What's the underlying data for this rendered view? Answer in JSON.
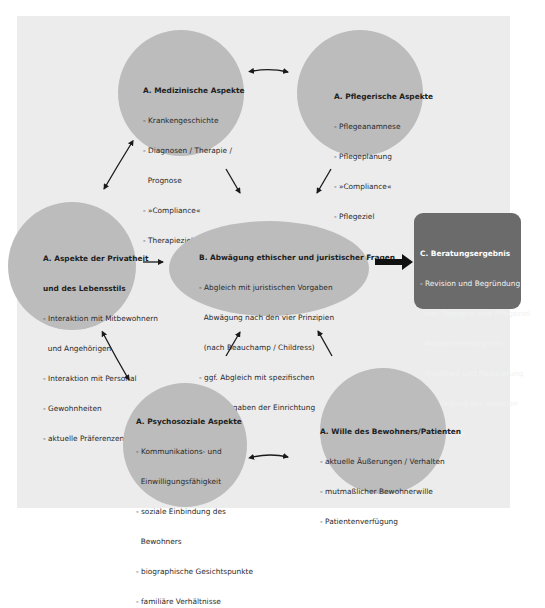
{
  "colors": {
    "page_background": "#ffffff",
    "frame_background": "#ececec",
    "bubble_fill": "#bcbcbc",
    "result_fill": "#6b6b6b",
    "arrow": "#1a1a1a"
  },
  "nodes": {
    "medical": {
      "title": "A. Medizinische Aspekte",
      "items": [
        "- Krankengeschichte",
        "- Diagnosen / Therapie /",
        "  Prognose",
        "- »Compliance«",
        "- Therapieziel"
      ]
    },
    "nursing": {
      "title": "A. Pflegerische Aspekte",
      "items": [
        "- Pflegeanamnese",
        "- Pflegeplanung",
        "- »Compliance«",
        "- Pflegeziel"
      ]
    },
    "privacy": {
      "title_line1": "A. Aspekte der Privatheit",
      "title_line2": "und des Lebensstils",
      "items": [
        "- Interaktion mit Mitbewohnern",
        "  und Angehörigen",
        "- Interaktion mit Personal",
        "- Gewohnheiten",
        "- aktuelle Präferenzen"
      ]
    },
    "deliberation": {
      "title": "B. Abwägung ethischer und juristischer Fragen",
      "items": [
        "- Abgleich mit juristischen Vorgaben",
        "  Abwägung nach den vier Prinzipien",
        "  (nach Beauchamp / Childress)",
        "- ggf. Abgleich mit spezifischen",
        "  Wertvorgaben der Einrichtung"
      ]
    },
    "result": {
      "title": "C. Beratungsergebnis",
      "items": [
        "- Revision und Begründung",
        "  von Therapie- und Pflegeziel",
        "- Neubestimmung von",
        "  Privatheit und Regulierung",
        "-  Festlegung des weiteren",
        "   Vorgehens"
      ]
    },
    "psychosocial": {
      "title": "A. Psychosoziale Aspekte",
      "items": [
        "- Kommunikations- und",
        "  Einwilligungsfähigkeit",
        "- soziale Einbindung des",
        "  Bewohners",
        "- biographische Gesichtspunkte",
        "- familiäre Verhältnisse"
      ]
    },
    "will": {
      "title": "A. Wille des Bewohners/Patienten",
      "items": [
        "- aktuelle Äußerungen / Verhalten",
        "- mutmaßlicher Bewohnerwille",
        "- Patientenverfügung"
      ]
    }
  },
  "edges": [
    {
      "from": "medical",
      "to": "nursing",
      "type": "bidirectional"
    },
    {
      "from": "medical",
      "to": "privacy",
      "type": "bidirectional"
    },
    {
      "from": "privacy",
      "to": "psychosocial",
      "type": "bidirectional"
    },
    {
      "from": "psychosocial",
      "to": "will",
      "type": "bidirectional"
    },
    {
      "from": "medical",
      "to": "deliberation",
      "type": "directed"
    },
    {
      "from": "nursing",
      "to": "deliberation",
      "type": "directed"
    },
    {
      "from": "privacy",
      "to": "deliberation",
      "type": "directed"
    },
    {
      "from": "psychosocial",
      "to": "deliberation",
      "type": "directed"
    },
    {
      "from": "will",
      "to": "deliberation",
      "type": "directed"
    },
    {
      "from": "deliberation",
      "to": "result",
      "type": "directed-bold"
    }
  ]
}
